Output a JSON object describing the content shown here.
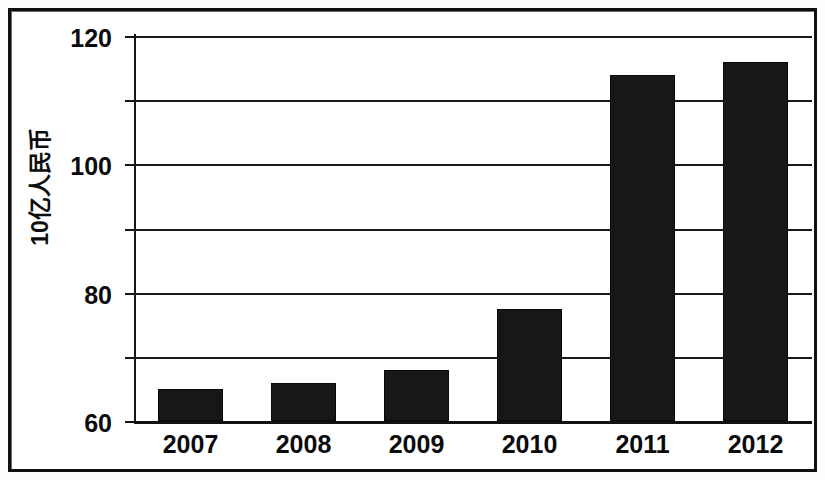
{
  "chart_data": {
    "type": "bar",
    "title": "",
    "subtitle": "",
    "xlabel": "",
    "ylabel": "10亿人民币",
    "categories": [
      "2007",
      "2008",
      "2009",
      "2010",
      "2011",
      "2012"
    ],
    "values": [
      10,
      12,
      16,
      35,
      108,
      112
    ],
    "series": [
      {
        "name": "",
        "values": [
          10,
          12,
          16,
          35,
          108,
          112
        ]
      }
    ],
    "ylim": [
      0,
      120
    ],
    "yticks": [
      0,
      20,
      40,
      60,
      80,
      100,
      120
    ],
    "ytick_labels": [
      "0",
      "20",
      "40",
      "60",
      "80",
      "100",
      "120"
    ],
    "grid": true,
    "grid_axis": "y",
    "legend": false,
    "legend_position": "none",
    "bar_color": "#171717",
    "axis_color": "#111111",
    "background_color": "#ffffff"
  }
}
